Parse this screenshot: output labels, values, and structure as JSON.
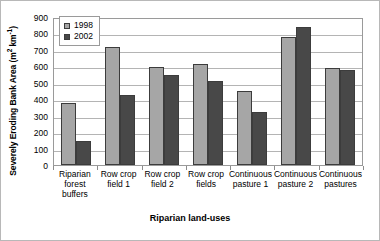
{
  "chart_data": {
    "type": "bar",
    "title": "",
    "xlabel": "Riparian land-uses",
    "ylabel": "Severely Eroding Bank Area (m² km⁻¹)",
    "ylabel_base": "Severely Eroding Bank Area (m",
    "ylabel_sup1": "2",
    "ylabel_mid": " km",
    "ylabel_sup2": "-1",
    "ylabel_end": ")",
    "ylim": [
      0,
      900
    ],
    "ytick_step": 100,
    "yticks": [
      "900",
      "800",
      "700",
      "600",
      "500",
      "400",
      "300",
      "200",
      "100",
      "0"
    ],
    "grid": true,
    "legend_position": "top-left-inside",
    "categories": [
      "Riparian forest buffers",
      "Row crop field 1",
      "Row crop field 2",
      "Row crop fields",
      "Continuous pasture 1",
      "Continuous pasture 2",
      "Continuous pastures"
    ],
    "category_lines": [
      [
        "Riparian",
        "forest",
        "buffers"
      ],
      [
        "Row crop",
        "field 1"
      ],
      [
        "Row crop",
        "field 2"
      ],
      [
        "Row crop",
        "fields"
      ],
      [
        "Continuous",
        "pasture 1"
      ],
      [
        "Continuous",
        "pasture 2"
      ],
      [
        "Continuous",
        "pastures"
      ]
    ],
    "series": [
      {
        "name": "1998",
        "color": "#a6a6a6",
        "values": [
          375,
          720,
          595,
          615,
          450,
          780,
          590
        ]
      },
      {
        "name": "2002",
        "color": "#484848",
        "values": [
          145,
          425,
          550,
          510,
          320,
          840,
          575
        ]
      }
    ]
  },
  "legend": {
    "items": [
      {
        "label": "1998",
        "swatch": "legend-swatch-1998"
      },
      {
        "label": "2002",
        "swatch": "legend-swatch-2002"
      }
    ]
  }
}
